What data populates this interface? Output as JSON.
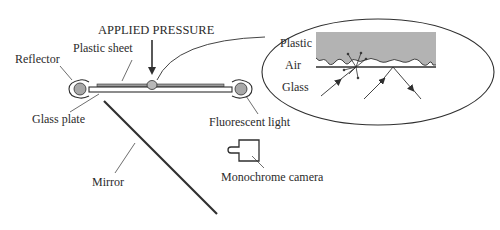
{
  "diagram": {
    "title_annotation": "APPLIED PRESSURE",
    "labels": {
      "reflector": "Reflector",
      "plastic_sheet": "Plastic sheet",
      "glass_plate": "Glass plate",
      "fluorescent_light": "Fluorescent light",
      "mirror": "Mirror",
      "camera": "Monochrome camera"
    },
    "inset": {
      "plastic": "Plastic",
      "air": "Air",
      "glass": "Glass"
    },
    "colors": {
      "line": "#2f2f2f",
      "plastic_fill": "#b3b3b3",
      "lamp_fill": "#a8a8a8",
      "background": "#ffffff"
    }
  }
}
